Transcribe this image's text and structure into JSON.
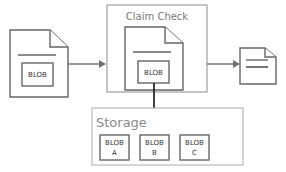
{
  "diagram": {
    "claim_check": {
      "title": "Claim Check",
      "blob_label": "BLOB"
    },
    "source_message": {
      "blob_label": "BLOB"
    },
    "storage": {
      "title": "Storage",
      "blobs": [
        {
          "line1": "BLOB",
          "line2": "A"
        },
        {
          "line1": "BLOB",
          "line2": "B"
        },
        {
          "line1": "BLOB",
          "line2": "C"
        }
      ]
    },
    "colors": {
      "stroke": "#666666",
      "arrow": "#707070",
      "down_arrow": "#111111"
    }
  }
}
